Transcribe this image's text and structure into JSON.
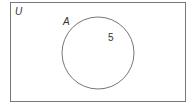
{
  "diagram": {
    "type": "venn",
    "universal_label": "U",
    "set_label": "A",
    "region_value": "5",
    "stroke_color": "#777777"
  }
}
